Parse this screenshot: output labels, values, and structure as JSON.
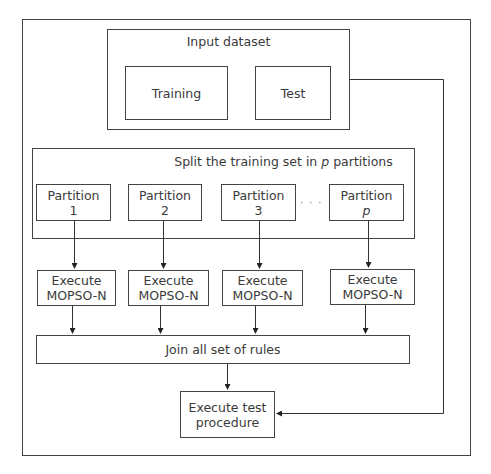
{
  "diagram": {
    "input_dataset": {
      "title": "Input dataset",
      "training": "Training",
      "test": "Test"
    },
    "split": {
      "title_prefix": "Split the training set in ",
      "title_var": "p",
      "title_suffix": " partitions",
      "partitions": [
        {
          "line1": "Partition",
          "line2": "1"
        },
        {
          "line1": "Partition",
          "line2": "2"
        },
        {
          "line1": "Partition",
          "line2": "3"
        },
        {
          "line1": "Partition",
          "line2": "p"
        }
      ],
      "ellipsis": "· · ·"
    },
    "execute": [
      {
        "line1": "Execute",
        "line2": "MOPSO-N"
      },
      {
        "line1": "Execute",
        "line2": "MOPSO-N"
      },
      {
        "line1": "Execute",
        "line2": "MOPSO-N"
      },
      {
        "line1": "Execute",
        "line2": "MOPSO-N"
      }
    ],
    "join": "Join all set of rules",
    "test_procedure": {
      "line1": "Execute test",
      "line2": "procedure"
    }
  }
}
